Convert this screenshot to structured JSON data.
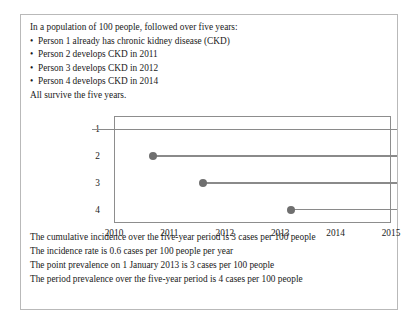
{
  "scenario": {
    "intro": "In a population of 100 people, followed over five years:",
    "bullet_marker": "•",
    "bullets": [
      "Person 1 already has chronic kidney disease (CKD)",
      "Person 2 develops CKD in 2011",
      "Person 3 develops CKD in 2012",
      "Person 4 develops CKD in 2014"
    ],
    "closing": "All survive the five years."
  },
  "measures": [
    "The cumulative incidence over the five-year period is 3 cases per 100 people",
    "The incidence rate is 0.6 cases per 100 people per year",
    "The point prevalence on 1 January 2013 is 3 cases per 100 people",
    "The period prevalence over the five-year period is 4 cases per 100 people"
  ],
  "chart_data": {
    "type": "line",
    "title": "",
    "xlabel": "",
    "ylabel": "",
    "xlim": [
      2010,
      2015
    ],
    "ylim": [
      0.5,
      4.5
    ],
    "grid": false,
    "legend": "none",
    "x_ticks": [
      "2010",
      "2011",
      "2012",
      "2013",
      "2014",
      "2015"
    ],
    "x_tick_values": [
      2010,
      2011,
      2012,
      2013,
      2014,
      2015
    ],
    "y_ticks": [
      "1",
      "2",
      "3",
      "4"
    ],
    "y_tick_values": [
      1,
      2,
      3,
      4
    ],
    "series": [
      {
        "name": "Person 1",
        "person": 1,
        "onset_year": 2009.6,
        "onset_marker": false,
        "end_year": 2015.1,
        "note": "already has CKD before follow-up begins"
      },
      {
        "name": "Person 2",
        "person": 2,
        "onset_year": 2010.7,
        "onset_marker": true,
        "end_year": 2015.1,
        "note": "develops CKD in 2011"
      },
      {
        "name": "Person 3",
        "person": 3,
        "onset_year": 2011.6,
        "onset_marker": true,
        "end_year": 2015.1,
        "note": "develops CKD in 2012"
      },
      {
        "name": "Person 4",
        "person": 4,
        "onset_year": 2013.2,
        "onset_marker": true,
        "end_year": 2015.1,
        "note": "develops CKD in 2014"
      }
    ],
    "colors": {
      "line": "#8a8a8a",
      "marker": "#6f6f6f",
      "axis": "#8d8d8d",
      "frame": "#b9b9b9",
      "text": "#1a1a1a"
    }
  }
}
